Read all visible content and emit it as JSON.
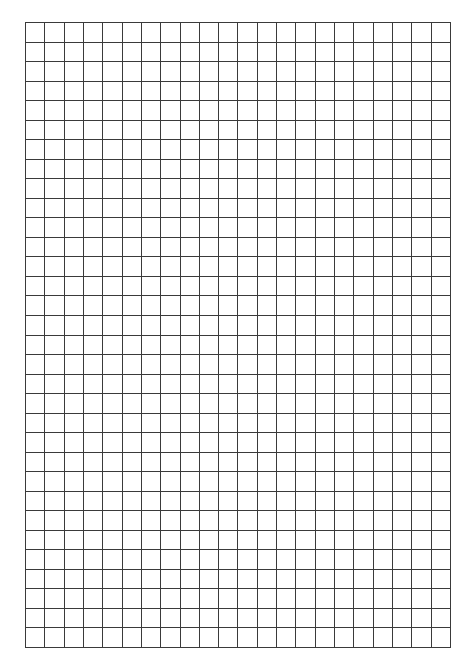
{
  "page": {
    "type": "graph-paper",
    "background": "#ffffff"
  },
  "grid": {
    "left": 25,
    "top": 22,
    "width": 425,
    "height": 625,
    "columns": 22,
    "rows": 32,
    "line_color": "#3a3a3a",
    "line_width": 1
  }
}
